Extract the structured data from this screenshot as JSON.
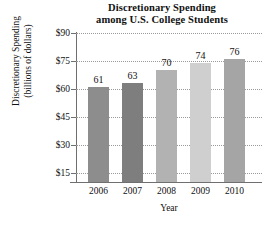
{
  "chart_data": {
    "type": "bar",
    "title": "Discretionary Spending among U.S. College Students",
    "title_lines": [
      "Discretionary Spending",
      "among U.S. College Students"
    ],
    "categories": [
      "2006",
      "2007",
      "2008",
      "2009",
      "2010"
    ],
    "values": [
      61,
      63,
      70,
      74,
      76
    ],
    "value_labels": [
      "61",
      "63",
      "70",
      "74",
      "76"
    ],
    "xlabel": "Year",
    "ylabel": "Discretionary Spending (billions of dollars)",
    "ylabel_lines": [
      "Discretionary Spending",
      "(billions of dollars)"
    ],
    "ylim": [
      0,
      90
    ],
    "yticks": [
      90,
      75,
      60,
      45,
      30,
      15
    ],
    "ytick_labels": [
      "$90",
      "$75",
      "$60",
      "$45",
      "$30",
      "$15"
    ],
    "grid": true,
    "legend": "none",
    "bar_colors": [
      "#8d8d8d",
      "#7e7e7e",
      "#b2b2b2",
      "#cfcfcf",
      "#a5a5a5"
    ],
    "axis_color": "#6f6f6f",
    "grid_color": "#9a9a9a",
    "background": "#ffffff"
  }
}
